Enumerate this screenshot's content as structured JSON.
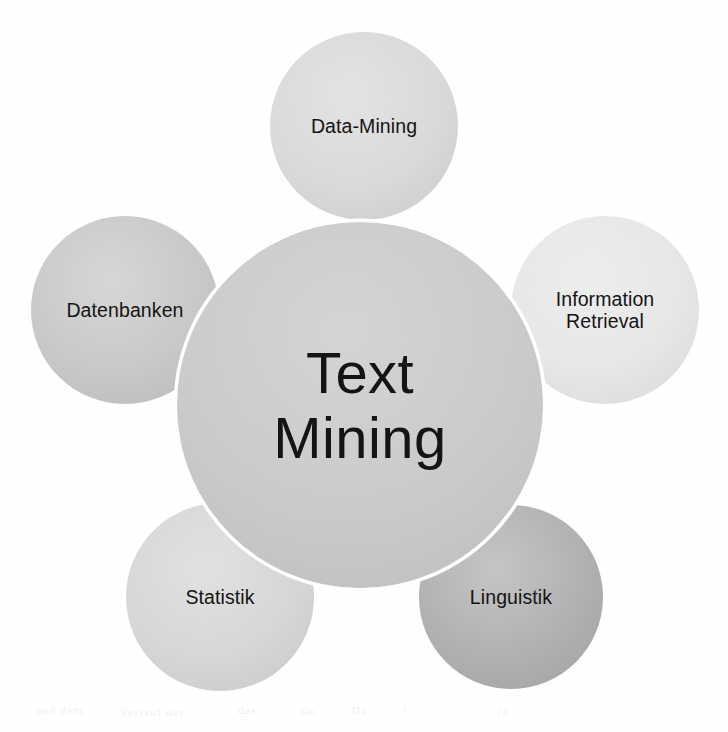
{
  "diagram": {
    "title": "Text Mining",
    "type": "venn-cluster",
    "background_color": "#ffffff",
    "text_color": "#141414",
    "ring_color": "#ffffff",
    "center": {
      "id": "text-mining",
      "label": "Text\nMining",
      "cx": 360,
      "cy": 405,
      "r": 183,
      "fill": "#c9c9c9"
    },
    "satellites": [
      {
        "id": "data-mining",
        "label": "Data-Mining",
        "cx": 364,
        "cy": 126,
        "r": 94,
        "fill": "#d8d8d8",
        "label_dy": 0
      },
      {
        "id": "information-retrieval",
        "label": "Information\nRetrieval",
        "cx": 605,
        "cy": 310,
        "r": 94,
        "fill": "#e6e6e6",
        "label_dy": 0
      },
      {
        "id": "linguistik",
        "label": "Linguistik",
        "cx": 511,
        "cy": 597,
        "r": 92,
        "fill": "#adadad",
        "label_dy": 0
      },
      {
        "id": "statistik",
        "label": "Statistik",
        "cx": 220,
        "cy": 597,
        "r": 94,
        "fill": "#d5d5d5",
        "label_dy": 0
      },
      {
        "id": "datenbanken",
        "label": "Datenbanken",
        "cx": 125,
        "cy": 310,
        "r": 94,
        "fill": "#c6c6c6",
        "label_dy": 0
      }
    ],
    "bleed_ghosts": [
      {
        "text": "und dem",
        "x": 36,
        "y": 704
      },
      {
        "text": "Verlauf der",
        "x": 120,
        "y": 706
      },
      {
        "text": "das",
        "x": 238,
        "y": 704
      },
      {
        "text": "Ge",
        "x": 300,
        "y": 705
      },
      {
        "text": "Da",
        "x": 352,
        "y": 704
      },
      {
        "text": "t",
        "x": 404,
        "y": 703
      },
      {
        "text": "in",
        "x": 498,
        "y": 705
      }
    ]
  }
}
